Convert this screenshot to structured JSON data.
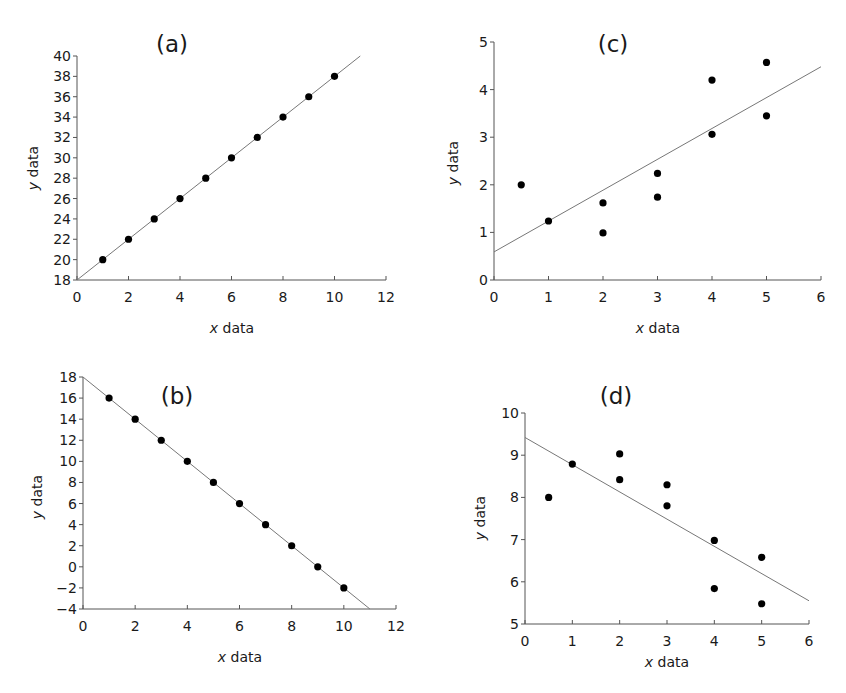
{
  "figure": {
    "background": "#ffffff",
    "dot_color": "#000000",
    "line_color": "#777777",
    "axis_color": "#555555"
  },
  "chart_data": [
    {
      "id": "a",
      "type": "scatter",
      "title": "(a)",
      "xlabel_italic": "x",
      "xlabel_rest": " data",
      "ylabel_italic": "y",
      "ylabel_rest": " data",
      "xlim": [
        0,
        12
      ],
      "ylim": [
        18,
        40
      ],
      "xticks": [
        0,
        2,
        4,
        6,
        8,
        10,
        12
      ],
      "yticks": [
        18,
        20,
        22,
        24,
        26,
        28,
        30,
        32,
        34,
        36,
        38,
        40
      ],
      "points": [
        [
          1,
          20
        ],
        [
          2,
          22
        ],
        [
          3,
          24
        ],
        [
          4,
          26
        ],
        [
          5,
          28
        ],
        [
          6,
          30
        ],
        [
          7,
          32
        ],
        [
          8,
          34
        ],
        [
          9,
          36
        ],
        [
          10,
          38
        ]
      ],
      "fit_line": [
        [
          0,
          18
        ],
        [
          11,
          40
        ]
      ],
      "box": {
        "left": 77,
        "right": 386,
        "top": 56,
        "bottom": 280
      },
      "title_pos": [
        172,
        52
      ],
      "ylabel_pos": [
        38,
        168
      ],
      "xlabel_pos": [
        232,
        333
      ]
    },
    {
      "id": "c",
      "type": "scatter",
      "title": "(c)",
      "xlabel_italic": "x",
      "xlabel_rest": " data",
      "ylabel_italic": "y",
      "ylabel_rest": " data",
      "xlim": [
        0,
        6
      ],
      "ylim": [
        0,
        5
      ],
      "xticks": [
        0,
        1,
        2,
        3,
        4,
        5,
        6
      ],
      "yticks": [
        0,
        1,
        2,
        3,
        4,
        5
      ],
      "points": [
        [
          0.5,
          2.0
        ],
        [
          1,
          1.24
        ],
        [
          2,
          1.62
        ],
        [
          2,
          0.99
        ],
        [
          3,
          2.24
        ],
        [
          3,
          1.74
        ],
        [
          4,
          4.2
        ],
        [
          4,
          3.06
        ],
        [
          5,
          4.57
        ],
        [
          5,
          3.45
        ]
      ],
      "fit_line": [
        [
          0,
          0.59
        ],
        [
          6,
          4.48
        ]
      ],
      "box": {
        "left": 494,
        "right": 821,
        "top": 42,
        "bottom": 280
      },
      "title_pos": [
        613,
        52
      ],
      "ylabel_pos": [
        458,
        163
      ],
      "xlabel_pos": [
        658,
        333
      ]
    },
    {
      "id": "b",
      "type": "scatter",
      "title": "(b)",
      "xlabel_italic": "x",
      "xlabel_rest": " data",
      "ylabel_italic": "y",
      "ylabel_rest": " data",
      "xlim": [
        0,
        12
      ],
      "ylim": [
        -4,
        18
      ],
      "xticks": [
        0,
        2,
        4,
        6,
        8,
        10,
        12
      ],
      "yticks": [
        -4,
        -2,
        0,
        2,
        4,
        6,
        8,
        10,
        12,
        14,
        16,
        18
      ],
      "ytick_labels": [
        "−4",
        "−2",
        "0",
        "2",
        "4",
        "6",
        "8",
        "10",
        "12",
        "14",
        "16",
        "18"
      ],
      "points": [
        [
          1,
          16
        ],
        [
          2,
          14
        ],
        [
          3,
          12
        ],
        [
          4,
          10
        ],
        [
          5,
          8
        ],
        [
          6,
          6
        ],
        [
          7,
          4
        ],
        [
          8,
          2
        ],
        [
          9,
          0
        ],
        [
          10,
          -2
        ]
      ],
      "fit_line": [
        [
          0,
          18
        ],
        [
          11,
          -4
        ]
      ],
      "box": {
        "left": 83,
        "right": 396,
        "top": 377,
        "bottom": 609
      },
      "title_pos": [
        177,
        404
      ],
      "ylabel_pos": [
        42,
        497
      ],
      "xlabel_pos": [
        240,
        662
      ]
    },
    {
      "id": "d",
      "type": "scatter",
      "title": "(d)",
      "xlabel_italic": "x",
      "xlabel_rest": " data",
      "ylabel_italic": "y",
      "ylabel_rest": " data",
      "xlim": [
        0,
        6
      ],
      "ylim": [
        5,
        10
      ],
      "xticks": [
        0,
        1,
        2,
        3,
        4,
        5,
        6
      ],
      "yticks": [
        5,
        6,
        7,
        8,
        9,
        10
      ],
      "points": [
        [
          0.5,
          8.0
        ],
        [
          1,
          8.79
        ],
        [
          2,
          9.03
        ],
        [
          2,
          8.42
        ],
        [
          3,
          8.3
        ],
        [
          3,
          7.8
        ],
        [
          4,
          6.98
        ],
        [
          4,
          5.84
        ],
        [
          5,
          6.58
        ],
        [
          5,
          5.48
        ]
      ],
      "fit_line": [
        [
          0,
          9.42
        ],
        [
          6,
          5.55
        ]
      ],
      "box": {
        "left": 525,
        "right": 809,
        "top": 413,
        "bottom": 624
      },
      "title_pos": [
        616,
        404
      ],
      "ylabel_pos": [
        485,
        518
      ],
      "xlabel_pos": [
        667,
        667
      ]
    }
  ]
}
